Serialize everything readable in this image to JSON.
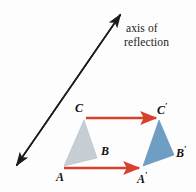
{
  "figure": {
    "title_line1": "axis of",
    "title_line2": "reflection",
    "colors": {
      "axis_line": "#1a1a1a",
      "arrow_red": "#d6402c",
      "preimage_fill": "#c4ced4",
      "image_fill": "#6f9ec4",
      "background": "#fdfdfd",
      "label_text": "#111111"
    },
    "axis": {
      "name": "axis of reflection",
      "double_headed": true,
      "start": [
        13,
        170
      ],
      "end": [
        124,
        10
      ]
    },
    "labels": {
      "C": "C",
      "C_prime": "C",
      "B": "B",
      "B_prime": "B",
      "A": "A",
      "A_prime": "A",
      "prime_mark": "′"
    },
    "preimage_triangle": {
      "name": "triangle ABC",
      "vertices": {
        "A": [
          64,
          166
        ],
        "B": [
          97,
          158
        ],
        "C": [
          84,
          120
        ]
      }
    },
    "image_triangle": {
      "name": "triangle A'B'C'",
      "vertices": {
        "A": [
          143,
          166
        ],
        "B": [
          174,
          155
        ],
        "C": [
          159,
          120
        ]
      }
    },
    "correspondence_arrows": [
      {
        "name": "arrow-C-to-Cprime",
        "from": [
          86,
          118
        ],
        "to": [
          159,
          118
        ]
      },
      {
        "name": "arrow-A-to-Aprime",
        "from": [
          64,
          168
        ],
        "to": [
          142,
          168
        ]
      }
    ]
  }
}
